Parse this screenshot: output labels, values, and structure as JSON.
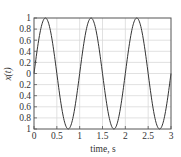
{
  "chart_data": {
    "type": "line",
    "title": "",
    "xlabel": "time, s",
    "ylabel": "x(t)",
    "xlim": [
      0,
      3
    ],
    "ylim": [
      -1,
      1
    ],
    "grid": true,
    "legend": null,
    "x_ticks": [
      "0",
      "0.5",
      "1",
      "1.5",
      "2",
      "2.5",
      "3"
    ],
    "x_tick_values": [
      0,
      0.5,
      1,
      1.5,
      2,
      2.5,
      3
    ],
    "y_ticks": [
      "1",
      "0.8",
      "0.6",
      "0.4",
      "0.2",
      "0",
      "0.2",
      "0.4",
      "0.6",
      "0.8",
      "1"
    ],
    "y_tick_values": [
      1,
      0.8,
      0.6,
      0.4,
      0.2,
      0,
      -0.2,
      -0.4,
      -0.6,
      -0.8,
      -1
    ],
    "series": [
      {
        "name": "x(t) = sin(2πt)",
        "color": "#333333",
        "x": [
          0,
          0.125,
          0.25,
          0.375,
          0.5,
          0.625,
          0.75,
          0.875,
          1.0,
          1.125,
          1.25,
          1.375,
          1.5,
          1.625,
          1.75,
          1.875,
          2.0,
          2.125,
          2.25,
          2.375,
          2.5,
          2.625,
          2.75,
          2.875,
          3.0
        ],
        "values": [
          0,
          0.707,
          1,
          0.707,
          0,
          -0.707,
          -1,
          -0.707,
          0,
          0.707,
          1,
          0.707,
          0,
          -0.707,
          -1,
          -0.707,
          0,
          0.707,
          1,
          0.707,
          0,
          -0.707,
          -1,
          -0.707,
          0
        ]
      }
    ]
  },
  "colors": {
    "axis": "#555555",
    "grid": "#d9d9d9",
    "line": "#333333",
    "text": "#333333"
  }
}
